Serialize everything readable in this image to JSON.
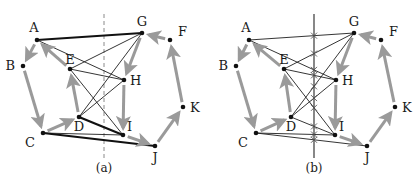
{
  "figure": {
    "panels": [
      {
        "id": "a",
        "label": "(a)",
        "cut_line": {
          "style": "dashed",
          "x": 104
        },
        "nodes": [
          {
            "id": "A",
            "label": "A",
            "x": 37,
            "y": 40
          },
          {
            "id": "B",
            "label": "B",
            "x": 23,
            "y": 66
          },
          {
            "id": "C",
            "label": "C",
            "x": 43,
            "y": 133
          },
          {
            "id": "D",
            "label": "D",
            "x": 79,
            "y": 117
          },
          {
            "id": "E",
            "label": "E",
            "x": 70,
            "y": 69
          },
          {
            "id": "F",
            "label": "F",
            "x": 170,
            "y": 40
          },
          {
            "id": "G",
            "label": "G",
            "x": 142,
            "y": 33
          },
          {
            "id": "H",
            "label": "H",
            "x": 124,
            "y": 80
          },
          {
            "id": "I",
            "label": "I",
            "x": 123,
            "y": 135
          },
          {
            "id": "J",
            "label": "J",
            "x": 155,
            "y": 146
          },
          {
            "id": "K",
            "label": "K",
            "x": 183,
            "y": 107
          }
        ]
      },
      {
        "id": "b",
        "label": "(b)",
        "cut_line": {
          "style": "solid-with-crossing-marks",
          "x": 314
        },
        "nodes": [
          {
            "id": "A",
            "label": "A",
            "x": 249,
            "y": 40
          },
          {
            "id": "B",
            "label": "B",
            "x": 236,
            "y": 66
          },
          {
            "id": "C",
            "label": "C",
            "x": 256,
            "y": 133
          },
          {
            "id": "D",
            "label": "D",
            "x": 291,
            "y": 117
          },
          {
            "id": "E",
            "label": "E",
            "x": 284,
            "y": 69
          },
          {
            "id": "F",
            "label": "F",
            "x": 381,
            "y": 40
          },
          {
            "id": "G",
            "label": "G",
            "x": 354,
            "y": 33
          },
          {
            "id": "H",
            "label": "H",
            "x": 336,
            "y": 80
          },
          {
            "id": "I",
            "label": "I",
            "x": 335,
            "y": 135
          },
          {
            "id": "J",
            "label": "J",
            "x": 367,
            "y": 146
          },
          {
            "id": "K",
            "label": "K",
            "x": 395,
            "y": 107
          }
        ]
      }
    ],
    "directed_cycle_edges": [
      [
        "A",
        "B"
      ],
      [
        "B",
        "C"
      ],
      [
        "C",
        "D"
      ],
      [
        "D",
        "E"
      ],
      [
        "E",
        "A"
      ],
      [
        "F",
        "G"
      ],
      [
        "G",
        "H"
      ],
      [
        "H",
        "I"
      ],
      [
        "I",
        "J"
      ],
      [
        "J",
        "K"
      ],
      [
        "K",
        "F"
      ]
    ],
    "panel_a_thick_edges": [
      [
        "A",
        "G"
      ],
      [
        "D",
        "I"
      ],
      [
        "C",
        "J"
      ]
    ],
    "panel_a_thin_edges": [
      [
        "A",
        "H"
      ],
      [
        "E",
        "G"
      ],
      [
        "E",
        "H"
      ],
      [
        "E",
        "I"
      ],
      [
        "D",
        "G"
      ],
      [
        "D",
        "H"
      ],
      [
        "C",
        "I"
      ]
    ],
    "panel_b_edges": [
      [
        "A",
        "G"
      ],
      [
        "A",
        "H"
      ],
      [
        "E",
        "G"
      ],
      [
        "E",
        "H"
      ],
      [
        "E",
        "I"
      ],
      [
        "D",
        "G"
      ],
      [
        "D",
        "H"
      ],
      [
        "D",
        "I"
      ],
      [
        "C",
        "I"
      ],
      [
        "C",
        "J"
      ]
    ],
    "colors": {
      "arrow": "#9a9a9a",
      "edge": "#1e1e1e",
      "node": "#111111"
    }
  }
}
